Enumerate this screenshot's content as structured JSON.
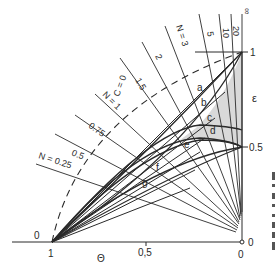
{
  "diagram": {
    "axes": {
      "theta_label": "Θ",
      "epsilon_label": "ε",
      "theta_ticks": [
        "1",
        "0,5",
        "0"
      ],
      "epsilon_ticks": [
        "0",
        "0.5",
        "1"
      ],
      "origin_left_label": "0"
    },
    "n_lines": [
      {
        "label": "N = 0.25"
      },
      {
        "label": "0.5"
      },
      {
        "label": "0.75"
      },
      {
        "label": "N = 1"
      },
      {
        "label": "1.5"
      },
      {
        "label": "2"
      },
      {
        "label": "N = 3"
      },
      {
        "label": "5"
      },
      {
        "label": "10"
      },
      {
        "label": "20"
      },
      {
        "label": "∞"
      }
    ],
    "c_curve_label": "C = 0",
    "curve_labels": [
      "a",
      "b",
      "c",
      "d",
      "e",
      "f",
      "g"
    ],
    "colors": {
      "line": "#2a2a2a",
      "shade": "#c8c8c8",
      "background": "#ffffff"
    }
  }
}
